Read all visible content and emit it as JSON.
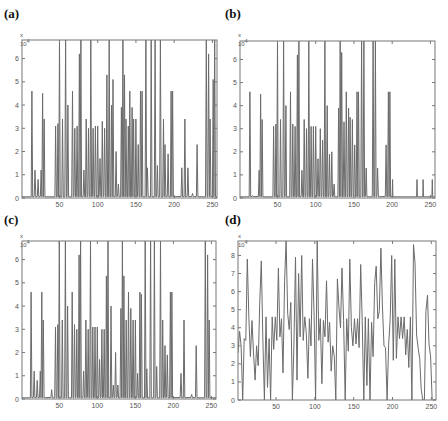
{
  "chart_data": [
    {
      "type": "line",
      "panel": "(a)",
      "exponent_label": "x 10^4",
      "x_range": [
        1,
        256
      ],
      "ylim": [
        0,
        6.8
      ],
      "yticks": [
        0,
        1,
        2,
        3,
        4,
        5,
        6
      ],
      "xticks": [
        50,
        100,
        150,
        200,
        250
      ],
      "peaks": [
        [
          14,
          4.6
        ],
        [
          18,
          1.2
        ],
        [
          22,
          0.8
        ],
        [
          26,
          1.2
        ],
        [
          28,
          4.5
        ],
        [
          30,
          3.4
        ],
        [
          45,
          3.1
        ],
        [
          48,
          3.2
        ],
        [
          50,
          6.8
        ],
        [
          54,
          3.4
        ],
        [
          58,
          6.8
        ],
        [
          61,
          4.0
        ],
        [
          67,
          4.6
        ],
        [
          70,
          3.0
        ],
        [
          73,
          3.1
        ],
        [
          76,
          6.2
        ],
        [
          78,
          6.8
        ],
        [
          82,
          1.2
        ],
        [
          85,
          3.4
        ],
        [
          88,
          3.0
        ],
        [
          91,
          6.8
        ],
        [
          94,
          3.0
        ],
        [
          97,
          3.1
        ],
        [
          100,
          3.1
        ],
        [
          103,
          1.7
        ],
        [
          106,
          3.3
        ],
        [
          109,
          3.0
        ],
        [
          112,
          5.3
        ],
        [
          115,
          6.8
        ],
        [
          118,
          4.0
        ],
        [
          120,
          5.1
        ],
        [
          124,
          2.0
        ],
        [
          127,
          0.6
        ],
        [
          131,
          3.9
        ],
        [
          133,
          6.8
        ],
        [
          135,
          5.3
        ],
        [
          137,
          3.4
        ],
        [
          140,
          3.1
        ],
        [
          142,
          4.6
        ],
        [
          145,
          3.9
        ],
        [
          147,
          3.4
        ],
        [
          150,
          3.4
        ],
        [
          153,
          2.3
        ],
        [
          156,
          4.6
        ],
        [
          158,
          4.6
        ],
        [
          163,
          6.8
        ],
        [
          165,
          1.3
        ],
        [
          170,
          6.8
        ],
        [
          175,
          6.8
        ],
        [
          178,
          1.4
        ],
        [
          182,
          6.8
        ],
        [
          186,
          3.4
        ],
        [
          188,
          2.3
        ],
        [
          192,
          1.9
        ],
        [
          196,
          4.6
        ],
        [
          198,
          4.6
        ],
        [
          210,
          1.3
        ],
        [
          214,
          3.4
        ],
        [
          218,
          1.3
        ],
        [
          224,
          0.2
        ],
        [
          230,
          2.3
        ],
        [
          242,
          6.8
        ],
        [
          245,
          6.2
        ],
        [
          247,
          3.4
        ],
        [
          251,
          5.1
        ],
        [
          253,
          6.8
        ]
      ]
    },
    {
      "type": "line",
      "panel": "(b)",
      "exponent_label": "x 10^4",
      "x_range": [
        1,
        256
      ],
      "ylim": [
        0,
        6.8
      ],
      "yticks": [
        0,
        1,
        2,
        3,
        4,
        5,
        6
      ],
      "xticks": [
        50,
        100,
        150,
        200,
        250
      ],
      "peaks": [
        [
          14,
          4.6
        ],
        [
          18,
          0.1
        ],
        [
          26,
          1.2
        ],
        [
          28,
          4.5
        ],
        [
          30,
          3.4
        ],
        [
          45,
          3.1
        ],
        [
          48,
          3.2
        ],
        [
          50,
          6.8
        ],
        [
          54,
          3.4
        ],
        [
          58,
          6.8
        ],
        [
          61,
          4.0
        ],
        [
          67,
          4.6
        ],
        [
          70,
          3.2
        ],
        [
          73,
          3.1
        ],
        [
          76,
          6.2
        ],
        [
          78,
          6.8
        ],
        [
          82,
          1.2
        ],
        [
          85,
          3.4
        ],
        [
          88,
          3.0
        ],
        [
          91,
          6.8
        ],
        [
          94,
          3.1
        ],
        [
          97,
          3.1
        ],
        [
          100,
          3.1
        ],
        [
          103,
          1.7
        ],
        [
          106,
          3.0
        ],
        [
          109,
          2.5
        ],
        [
          112,
          6.8
        ],
        [
          115,
          4.0
        ],
        [
          118,
          1.9
        ],
        [
          121,
          2.0
        ],
        [
          124,
          0.6
        ],
        [
          130,
          3.9
        ],
        [
          132,
          6.8
        ],
        [
          134,
          6.3
        ],
        [
          137,
          3.3
        ],
        [
          140,
          4.6
        ],
        [
          143,
          3.9
        ],
        [
          145,
          3.5
        ],
        [
          148,
          3.4
        ],
        [
          151,
          2.3
        ],
        [
          154,
          4.6
        ],
        [
          156,
          4.6
        ],
        [
          160,
          6.8
        ],
        [
          163,
          6.8
        ],
        [
          166,
          1.3
        ],
        [
          175,
          6.8
        ],
        [
          178,
          6.8
        ],
        [
          181,
          1.3
        ],
        [
          192,
          2.3
        ],
        [
          195,
          4.6
        ],
        [
          197,
          4.6
        ]
      ],
      "flat_segments": [
        [
          200,
          232,
          0.05
        ],
        [
          240,
          252,
          0.05
        ]
      ]
    },
    {
      "type": "line",
      "panel": "(c)",
      "exponent_label": "x 10^4",
      "x_range": [
        1,
        256
      ],
      "ylim": [
        0,
        6.8
      ],
      "yticks": [
        0,
        1,
        2,
        3,
        4,
        5,
        6
      ],
      "xticks": [
        50,
        100,
        150,
        200,
        250
      ],
      "peaks": [
        [
          13,
          4.6
        ],
        [
          17,
          1.2
        ],
        [
          21,
          0.8
        ],
        [
          25,
          1.2
        ],
        [
          27,
          4.6
        ],
        [
          29,
          3.4
        ],
        [
          40,
          0.4
        ],
        [
          45,
          3.1
        ],
        [
          48,
          3.2
        ],
        [
          50,
          6.8
        ],
        [
          54,
          3.4
        ],
        [
          58,
          6.8
        ],
        [
          61,
          4.0
        ],
        [
          67,
          4.6
        ],
        [
          70,
          3.2
        ],
        [
          73,
          3.0
        ],
        [
          76,
          6.2
        ],
        [
          78,
          6.8
        ],
        [
          82,
          1.2
        ],
        [
          85,
          3.4
        ],
        [
          88,
          3.0
        ],
        [
          91,
          6.8
        ],
        [
          94,
          3.1
        ],
        [
          97,
          3.1
        ],
        [
          100,
          3.1
        ],
        [
          103,
          1.7
        ],
        [
          106,
          3.0
        ],
        [
          109,
          3.0
        ],
        [
          112,
          5.3
        ],
        [
          114,
          6.8
        ],
        [
          118,
          4.0
        ],
        [
          121,
          0.6
        ],
        [
          124,
          2.0
        ],
        [
          127,
          0.6
        ],
        [
          131,
          3.9
        ],
        [
          133,
          6.8
        ],
        [
          135,
          5.3
        ],
        [
          138,
          3.4
        ],
        [
          141,
          4.6
        ],
        [
          144,
          3.9
        ],
        [
          147,
          3.4
        ],
        [
          150,
          3.4
        ],
        [
          153,
          1.1
        ],
        [
          156,
          4.6
        ],
        [
          158,
          4.5
        ],
        [
          163,
          6.8
        ],
        [
          165,
          1.3
        ],
        [
          170,
          6.8
        ],
        [
          175,
          6.8
        ],
        [
          178,
          1.4
        ],
        [
          183,
          6.8
        ],
        [
          186,
          3.4
        ],
        [
          189,
          2.3
        ],
        [
          192,
          1.9
        ],
        [
          196,
          4.6
        ],
        [
          198,
          4.6
        ],
        [
          210,
          1.1
        ],
        [
          214,
          3.4
        ],
        [
          224,
          0.2
        ],
        [
          230,
          2.3
        ],
        [
          242,
          6.8
        ],
        [
          245,
          6.2
        ],
        [
          247,
          3.4
        ]
      ]
    },
    {
      "type": "line",
      "panel": "(d)",
      "exponent_label": "x 10^4",
      "x_range": [
        1,
        256
      ],
      "ylim": [
        0,
        8.8
      ],
      "yticks": [
        0,
        1,
        2,
        3,
        4,
        5,
        6,
        7,
        8
      ],
      "xticks": [
        50,
        100,
        150,
        200,
        250
      ],
      "points": [
        [
          1,
          2.6
        ],
        [
          3,
          3.8
        ],
        [
          5,
          3.0
        ],
        [
          7,
          0.0
        ],
        [
          9,
          3.4
        ],
        [
          11,
          3.3
        ],
        [
          13,
          7.8
        ],
        [
          15,
          4.5
        ],
        [
          17,
          2.4
        ],
        [
          19,
          4.4
        ],
        [
          21,
          2.6
        ],
        [
          23,
          1.1
        ],
        [
          25,
          3.0
        ],
        [
          27,
          1.9
        ],
        [
          29,
          5.3
        ],
        [
          31,
          7.7
        ],
        [
          33,
          3.5
        ],
        [
          35,
          0.0
        ],
        [
          37,
          4.6
        ],
        [
          39,
          0.7
        ],
        [
          41,
          3.4
        ],
        [
          43,
          0.0
        ],
        [
          45,
          4.6
        ],
        [
          47,
          2.8
        ],
        [
          49,
          4.6
        ],
        [
          51,
          3.3
        ],
        [
          53,
          7.3
        ],
        [
          55,
          3.5
        ],
        [
          57,
          4.5
        ],
        [
          59,
          1.5
        ],
        [
          61,
          6.6
        ],
        [
          63,
          8.8
        ],
        [
          65,
          4.8
        ],
        [
          67,
          3.9
        ],
        [
          69,
          5.4
        ],
        [
          71,
          0.0
        ],
        [
          73,
          3.0
        ],
        [
          75,
          7.9
        ],
        [
          77,
          1.1
        ],
        [
          79,
          7.0
        ],
        [
          81,
          3.5
        ],
        [
          83,
          8.0
        ],
        [
          85,
          3.3
        ],
        [
          87,
          4.6
        ],
        [
          89,
          3.7
        ],
        [
          91,
          1.2
        ],
        [
          93,
          4.5
        ],
        [
          95,
          3.0
        ],
        [
          97,
          7.8
        ],
        [
          99,
          4.7
        ],
        [
          101,
          0.0
        ],
        [
          103,
          8.8
        ],
        [
          105,
          3.3
        ],
        [
          107,
          4.5
        ],
        [
          109,
          0.9
        ],
        [
          111,
          4.4
        ],
        [
          113,
          3.5
        ],
        [
          115,
          6.6
        ],
        [
          117,
          3.2
        ],
        [
          119,
          4.3
        ],
        [
          121,
          1.6
        ],
        [
          123,
          3.0
        ],
        [
          125,
          2.4
        ],
        [
          127,
          0.0
        ],
        [
          129,
          6.7
        ],
        [
          131,
          5.2
        ],
        [
          133,
          4.0
        ],
        [
          135,
          7.3
        ],
        [
          137,
          4.4
        ],
        [
          139,
          0.0
        ],
        [
          141,
          4.5
        ],
        [
          143,
          2.7
        ],
        [
          145,
          7.8
        ],
        [
          147,
          4.0
        ],
        [
          149,
          3.0
        ],
        [
          151,
          4.5
        ],
        [
          153,
          3.1
        ],
        [
          155,
          4.5
        ],
        [
          157,
          2.9
        ],
        [
          159,
          7.5
        ],
        [
          161,
          4.4
        ],
        [
          163,
          0.0
        ],
        [
          165,
          4.6
        ],
        [
          167,
          0.8
        ],
        [
          169,
          4.5
        ],
        [
          171,
          0.0
        ],
        [
          173,
          4.3
        ],
        [
          175,
          2.4
        ],
        [
          177,
          6.5
        ],
        [
          179,
          7.4
        ],
        [
          181,
          4.5
        ],
        [
          183,
          4.9
        ],
        [
          185,
          8.4
        ],
        [
          187,
          5.2
        ],
        [
          189,
          3.0
        ],
        [
          191,
          2.9
        ],
        [
          193,
          0.0
        ],
        [
          195,
          3.0
        ],
        [
          197,
          4.5
        ],
        [
          199,
          8.0
        ],
        [
          201,
          2.2
        ],
        [
          203,
          7.8
        ],
        [
          205,
          2.3
        ],
        [
          207,
          4.6
        ],
        [
          209,
          3.4
        ],
        [
          211,
          4.6
        ],
        [
          213,
          3.4
        ],
        [
          215,
          4.6
        ],
        [
          217,
          2.5
        ],
        [
          219,
          3.9
        ],
        [
          221,
          1.8
        ],
        [
          223,
          4.6
        ],
        [
          225,
          0.0
        ],
        [
          227,
          8.6
        ],
        [
          229,
          7.6
        ],
        [
          231,
          3.6
        ],
        [
          233,
          2.9
        ],
        [
          235,
          2.3
        ],
        [
          237,
          0.6
        ],
        [
          239,
          0.0
        ],
        [
          241,
          0.0
        ],
        [
          243,
          4.9
        ],
        [
          245,
          5.8
        ],
        [
          247,
          3.1
        ],
        [
          249,
          2.4
        ],
        [
          251,
          0.1
        ],
        [
          253,
          0.0
        ],
        [
          256,
          0.0
        ]
      ]
    }
  ],
  "panels": [
    {
      "label": "(a)",
      "exp": "x 10",
      "exp_sup": "4"
    },
    {
      "label": "(b)",
      "exp": "x 10",
      "exp_sup": "4"
    },
    {
      "label": "(c)",
      "exp": "x 10",
      "exp_sup": "4"
    },
    {
      "label": "(d)",
      "exp": "x 10",
      "exp_sup": "4"
    }
  ],
  "colors": {
    "line": "#6b6b6b",
    "frame": "#777777",
    "tick_text": "#555555"
  }
}
